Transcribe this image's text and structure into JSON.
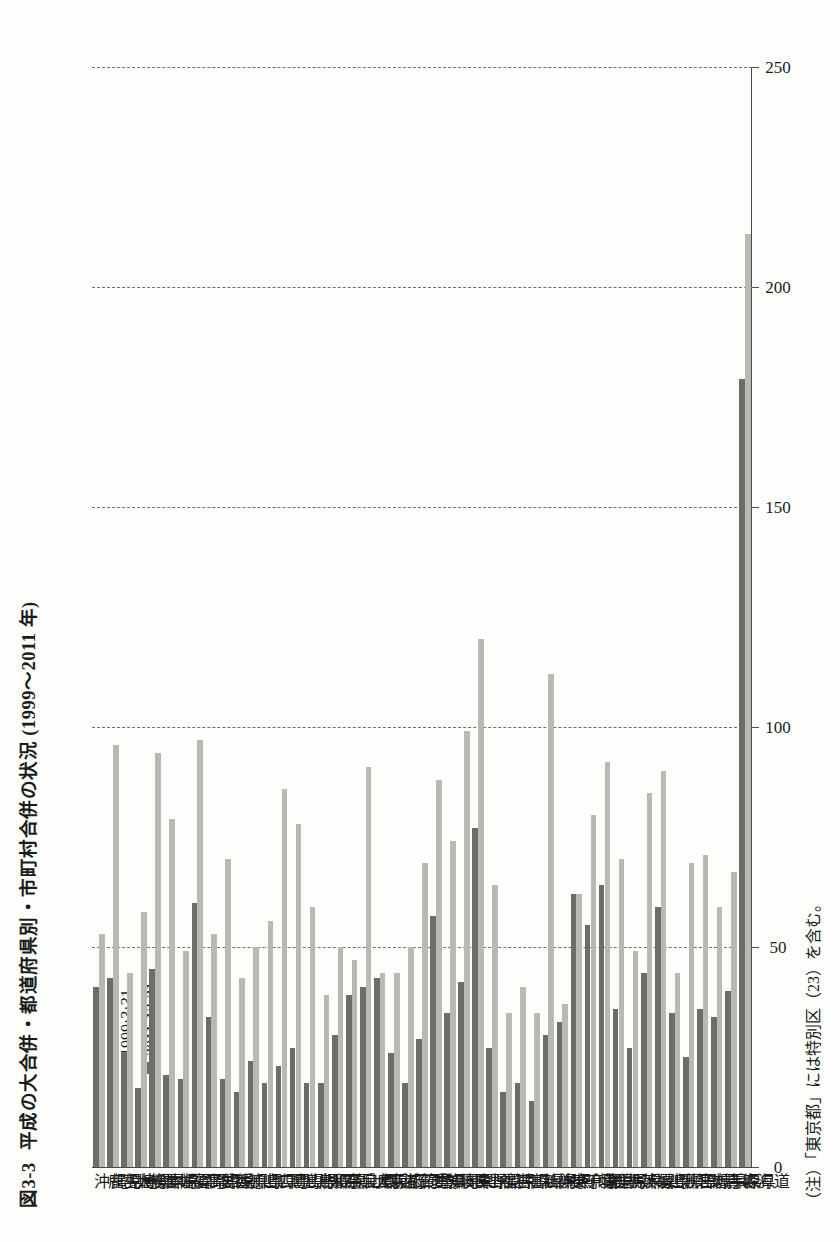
{
  "figure": {
    "number": "図3-3",
    "title": "平成の大合併・都道府県別・市町村合併の状況 (1999〜2011 年)",
    "footnote": "（注）「東京都」には特別区（23）を含む。"
  },
  "legend": {
    "position": "top-left",
    "items": [
      {
        "label": "1999·3·31",
        "color": "#b9b9b4",
        "icon": "square-swatch"
      },
      {
        "label": "2011·12·31",
        "color": "#6d6d68",
        "icon": "square-swatch"
      }
    ]
  },
  "axis": {
    "ticks": [
      "250",
      "200",
      "150",
      "100",
      "50",
      "0"
    ],
    "tick_values": [
      250,
      200,
      150,
      100,
      50,
      0
    ],
    "min": 0,
    "max": 250,
    "grid": true
  },
  "chart_data": {
    "type": "bar",
    "orientation": "horizontal",
    "xlabel": "",
    "ylabel": "市町村数",
    "xlim": [
      0,
      250
    ],
    "grid": true,
    "legend_position": "top-left",
    "categories": [
      "北海道",
      "青森県",
      "岩手県",
      "宮城県",
      "秋田県",
      "山形県",
      "福島県",
      "茨城県",
      "栃木県",
      "群馬県",
      "埼玉県",
      "千葉県",
      "東京都",
      "神奈川県",
      "新潟県",
      "富山県",
      "石川県",
      "福井県",
      "山梨県",
      "長野県",
      "岐阜県",
      "静岡県",
      "愛知県",
      "三重県",
      "滋賀県",
      "京都府",
      "大阪府",
      "兵庫県",
      "奈良県",
      "和歌山県",
      "鳥取県",
      "島根県",
      "岡山県",
      "広島県",
      "山口県",
      "徳島県",
      "香川県",
      "愛媛県",
      "高知県",
      "福岡県",
      "佐賀県",
      "長崎県",
      "熊本県",
      "大分県",
      "宮崎県",
      "鹿児島県",
      "沖縄県"
    ],
    "series": [
      {
        "name": "1999·3·31",
        "color": "#b9b9b4",
        "values": [
          212,
          67,
          59,
          71,
          69,
          44,
          90,
          85,
          49,
          70,
          92,
          80,
          62,
          37,
          112,
          35,
          41,
          35,
          64,
          120,
          99,
          74,
          88,
          69,
          50,
          44,
          44,
          91,
          47,
          50,
          39,
          59,
          78,
          86,
          56,
          50,
          43,
          70,
          53,
          97,
          49,
          79,
          94,
          58,
          44,
          96,
          53
        ]
      },
      {
        "name": "2011·12·31",
        "color": "#6d6d68",
        "values": [
          179,
          40,
          34,
          36,
          25,
          35,
          59,
          44,
          27,
          36,
          64,
          55,
          62,
          33,
          30,
          15,
          19,
          17,
          27,
          77,
          42,
          35,
          57,
          29,
          19,
          26,
          43,
          41,
          39,
          30,
          19,
          19,
          27,
          23,
          19,
          24,
          17,
          20,
          34,
          60,
          20,
          21,
          45,
          18,
          26,
          43,
          41
        ]
      }
    ]
  }
}
